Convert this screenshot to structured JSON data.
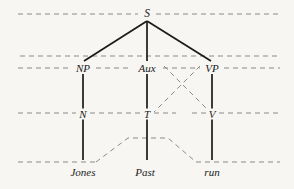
{
  "diagram": {
    "type": "phrase-structure-tree",
    "sentence": "Jones Past run",
    "background_color": "#f7f6f2",
    "solid_line_color": "#1a1a1a",
    "dashed_line_color": "#8a8a8a",
    "nodes": {
      "s": {
        "label": "S",
        "x": 147,
        "y": 14
      },
      "np": {
        "label": "NP",
        "x": 83,
        "y": 68
      },
      "aux": {
        "label": "Aux",
        "x": 147,
        "y": 68
      },
      "vp": {
        "label": "VP",
        "x": 212,
        "y": 68
      },
      "n": {
        "label": "N",
        "x": 83,
        "y": 114
      },
      "t": {
        "label": "T",
        "x": 147,
        "y": 114
      },
      "v": {
        "label": "V",
        "x": 212,
        "y": 114
      },
      "jones": {
        "label": "Jones",
        "x": 83,
        "y": 172
      },
      "past": {
        "label": "Past",
        "x": 145,
        "y": 172
      },
      "run": {
        "label": "run",
        "x": 212,
        "y": 172
      }
    },
    "levels": [
      {
        "name": "s-level",
        "y": 14
      },
      {
        "name": "upper-bracket-level",
        "y": 56
      },
      {
        "name": "phrase-level",
        "y": 68
      },
      {
        "name": "category-level",
        "y": 113
      },
      {
        "name": "terminal-level",
        "y": 162
      }
    ],
    "dashed_line_extent": {
      "x_start": 18,
      "x_end": 280
    }
  }
}
